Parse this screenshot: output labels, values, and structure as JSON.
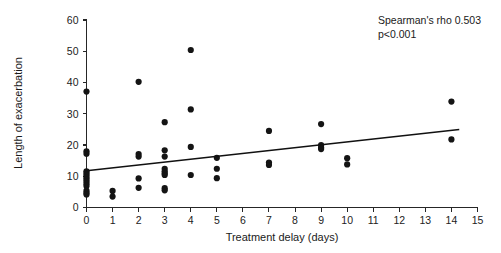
{
  "chart_data": {
    "type": "scatter",
    "title": "",
    "xlabel": "Treatment delay (days)",
    "ylabel": "Length of exacerbation",
    "xlim": [
      0,
      15
    ],
    "ylim": [
      0,
      60
    ],
    "xticks": [
      0,
      1,
      2,
      3,
      4,
      5,
      6,
      7,
      8,
      9,
      10,
      11,
      12,
      13,
      14,
      15
    ],
    "xtick_labels": [
      "0",
      "1",
      "2",
      "3",
      "4",
      "5",
      "6",
      "7",
      "8",
      "9",
      "10",
      "11",
      "12",
      "13",
      "14",
      "15"
    ],
    "yticks": [
      0,
      10,
      20,
      30,
      40,
      50,
      60
    ],
    "ytick_labels": [
      "0",
      "10",
      "20",
      "30",
      "40",
      "50",
      "60"
    ],
    "grid": false,
    "legend": false,
    "marker_color": "#141414",
    "marker_size": 3.1,
    "points": [
      {
        "x": 0,
        "y": 37.1
      },
      {
        "x": 0,
        "y": 18.0
      },
      {
        "x": 0,
        "y": 17.2
      },
      {
        "x": 0,
        "y": 11.6
      },
      {
        "x": 0,
        "y": 11.0
      },
      {
        "x": 0,
        "y": 10.3
      },
      {
        "x": 0,
        "y": 9.6
      },
      {
        "x": 0,
        "y": 9.0
      },
      {
        "x": 0,
        "y": 8.3
      },
      {
        "x": 0,
        "y": 7.6
      },
      {
        "x": 0,
        "y": 6.9
      },
      {
        "x": 0,
        "y": 5.4
      },
      {
        "x": 0,
        "y": 4.7
      },
      {
        "x": 0,
        "y": 4.2
      },
      {
        "x": 1,
        "y": 5.3
      },
      {
        "x": 1,
        "y": 3.5
      },
      {
        "x": 2,
        "y": 40.2
      },
      {
        "x": 2,
        "y": 17.1
      },
      {
        "x": 2,
        "y": 16.3
      },
      {
        "x": 2,
        "y": 9.3
      },
      {
        "x": 2,
        "y": 6.3
      },
      {
        "x": 3,
        "y": 27.3
      },
      {
        "x": 3,
        "y": 18.3
      },
      {
        "x": 3,
        "y": 16.3
      },
      {
        "x": 3,
        "y": 12.4
      },
      {
        "x": 3,
        "y": 11.6
      },
      {
        "x": 3,
        "y": 10.9
      },
      {
        "x": 3,
        "y": 10.4
      },
      {
        "x": 3,
        "y": 6.2
      },
      {
        "x": 3,
        "y": 5.5
      },
      {
        "x": 4,
        "y": 50.4
      },
      {
        "x": 4,
        "y": 31.4
      },
      {
        "x": 4,
        "y": 19.4
      },
      {
        "x": 4,
        "y": 10.4
      },
      {
        "x": 5,
        "y": 15.9
      },
      {
        "x": 5,
        "y": 12.4
      },
      {
        "x": 5,
        "y": 9.4
      },
      {
        "x": 7,
        "y": 24.5
      },
      {
        "x": 7,
        "y": 14.4
      },
      {
        "x": 7,
        "y": 13.6
      },
      {
        "x": 9,
        "y": 26.7
      },
      {
        "x": 9,
        "y": 20.0
      },
      {
        "x": 9,
        "y": 19.2
      },
      {
        "x": 9,
        "y": 18.7
      },
      {
        "x": 10,
        "y": 15.8
      },
      {
        "x": 10,
        "y": 13.8
      },
      {
        "x": 14,
        "y": 33.9
      },
      {
        "x": 14,
        "y": 21.8
      }
    ],
    "trendline": {
      "x_start": 0,
      "y_start": 11.8,
      "x_end": 14.3,
      "y_end": 25.0,
      "color": "#111111"
    },
    "annotations": [
      {
        "name": "spearman-rho",
        "text": "Spearman's rho 0.503"
      },
      {
        "name": "p-value",
        "text": "p<0.001"
      }
    ]
  }
}
